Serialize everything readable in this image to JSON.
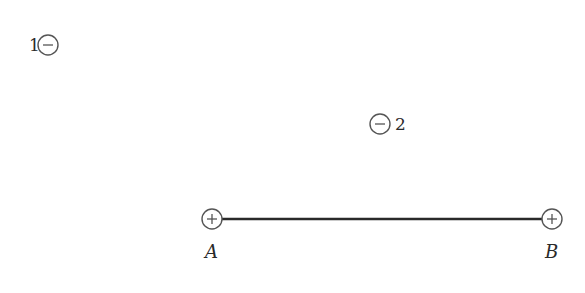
{
  "diagram": {
    "colors": {
      "stroke": "#555555",
      "rod": "#2a2a2a",
      "text": "#2a2a2a"
    },
    "charges": [
      {
        "id": "1",
        "label": "1",
        "sign": "−",
        "type": "negative",
        "cx": 48,
        "cy": 45
      },
      {
        "id": "2",
        "label": "2",
        "sign": "−",
        "type": "negative",
        "cx": 380,
        "cy": 124
      }
    ],
    "rod": {
      "endpoints": [
        {
          "id": "A",
          "label": "A",
          "sign": "+",
          "type": "positive",
          "cx": 212,
          "cy": 219
        },
        {
          "id": "B",
          "label": "B",
          "sign": "+",
          "type": "positive",
          "cx": 552,
          "cy": 219
        }
      ]
    }
  }
}
